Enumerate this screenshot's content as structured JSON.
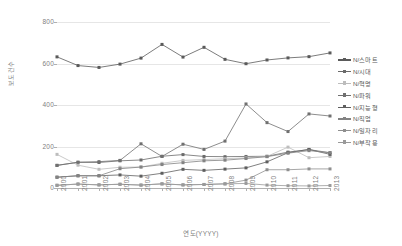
{
  "chart_data": {
    "type": "line",
    "title": "",
    "xlabel": "연도(YYYY)",
    "ylabel": "보도건수",
    "categories": [
      "2000",
      "2001",
      "2002",
      "2003",
      "2004",
      "2005",
      "2006",
      "2007",
      "2008",
      "2009",
      "2010",
      "2011",
      "2012",
      "2013"
    ],
    "ylim": [
      0,
      800
    ],
    "yticks": [
      0,
      200,
      400,
      600,
      800
    ],
    "grid": true,
    "legend_position": "right",
    "series": [
      {
        "name": "N/스마트",
        "color": "#5a5a5a",
        "values": [
          632,
          590,
          581,
          597,
          626,
          692,
          631,
          678,
          620,
          599,
          617,
          627,
          633,
          651
        ]
      },
      {
        "name": "N/시대",
        "color": "#6b6b6b",
        "values": [
          109,
          124,
          123,
          131,
          135,
          153,
          161,
          152,
          151,
          152,
          153,
          173,
          185,
          170
        ]
      },
      {
        "name": "N/혁명",
        "color": "#bdbdbd",
        "values": [
          162,
          110,
          90,
          100,
          101,
          119,
          133,
          137,
          141,
          145,
          152,
          197,
          146,
          152
        ]
      },
      {
        "name": "N/파워",
        "color": "#707070",
        "values": [
          109,
          124,
          127,
          133,
          213,
          152,
          211,
          186,
          226,
          405,
          315,
          272,
          357,
          347
        ]
      },
      {
        "name": "N/지능형",
        "color": "#5f5f5f",
        "values": [
          52,
          59,
          59,
          63,
          57,
          71,
          90,
          85,
          91,
          97,
          126,
          170,
          186,
          162
        ]
      },
      {
        "name": "N/직업",
        "color": "#838383",
        "values": [
          52,
          59,
          59,
          93,
          101,
          113,
          122,
          131,
          134,
          142,
          151,
          168,
          180,
          170
        ]
      },
      {
        "name": "N/일자리",
        "color": "#8f8f8f",
        "values": [
          13,
          19,
          15,
          18,
          14,
          20,
          15,
          17,
          20,
          38,
          88,
          88,
          92,
          92
        ]
      },
      {
        "name": "N/부작용",
        "color": "#9a9a9a",
        "values": [
          13,
          19,
          15,
          18,
          14,
          20,
          15,
          17,
          20,
          22,
          14,
          11,
          10,
          12
        ]
      }
    ]
  },
  "axes": {
    "y_tick_labels": [
      "800",
      "600",
      "400",
      "200",
      "0"
    ],
    "y_title": "보도건수",
    "x_title": "연도(YYYY)"
  },
  "colors": {
    "grid": "#e6e6e6",
    "axis": "#b0b0b0",
    "tick_text": "#808080",
    "legend_text": "#595959",
    "background": "#ffffff"
  }
}
